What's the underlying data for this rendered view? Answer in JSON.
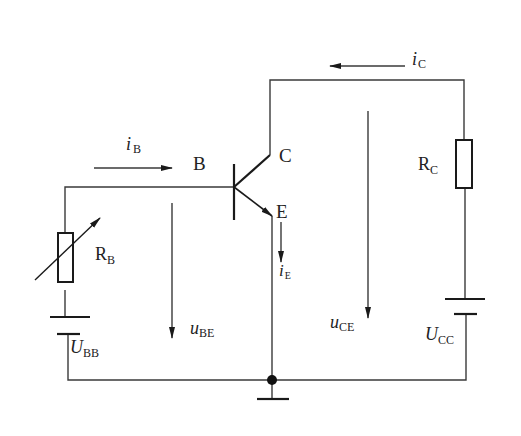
{
  "diagram": {
    "type": "common-emitter transistor circuit",
    "transistor": {
      "type": "NPN",
      "terminals": {
        "base": "B",
        "collector": "C",
        "emitter": "E"
      }
    },
    "components": {
      "rb": {
        "symbol": "R",
        "sub": "B",
        "kind": "variable resistor"
      },
      "rc": {
        "symbol": "R",
        "sub": "C",
        "kind": "resistor"
      },
      "ubb": {
        "symbol": "U",
        "sub": "BB",
        "kind": "battery"
      },
      "ucc": {
        "symbol": "U",
        "sub": "CC",
        "kind": "battery"
      }
    },
    "currents": {
      "ib": {
        "symbol": "i",
        "sub": "B"
      },
      "ic": {
        "symbol": "i",
        "sub": "C"
      },
      "ie": {
        "symbol": "i",
        "sub": "E"
      }
    },
    "voltages": {
      "ube": {
        "symbol": "u",
        "sub": "BE"
      },
      "uce": {
        "symbol": "u",
        "sub": "CE"
      }
    },
    "colors": {
      "line": "#3a3a3a",
      "stroke": "#1a1a1a",
      "background": "#ffffff"
    }
  }
}
